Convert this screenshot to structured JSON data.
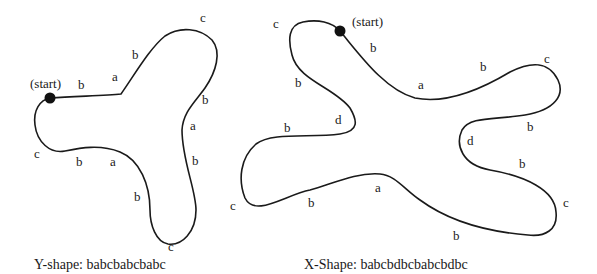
{
  "figure": {
    "y_shape": {
      "caption": "Y-shape: babcbabcbabc",
      "start_label": "(start)",
      "edge_labels": [
        {
          "text": "b",
          "x": 78,
          "y": 78
        },
        {
          "text": "a",
          "x": 112,
          "y": 70
        },
        {
          "text": "b",
          "x": 132,
          "y": 48
        },
        {
          "text": "c",
          "x": 200,
          "y": 11
        },
        {
          "text": "b",
          "x": 202,
          "y": 93
        },
        {
          "text": "a",
          "x": 190,
          "y": 119
        },
        {
          "text": "b",
          "x": 192,
          "y": 154
        },
        {
          "text": "b",
          "x": 134,
          "y": 190
        },
        {
          "text": "c",
          "x": 168,
          "y": 240
        },
        {
          "text": "a",
          "x": 110,
          "y": 155
        },
        {
          "text": "b",
          "x": 76,
          "y": 155
        },
        {
          "text": "c",
          "x": 34,
          "y": 147
        }
      ]
    },
    "x_shape": {
      "caption": "X-Shape: babcbdbcbabcbdbc",
      "start_label": "(start)",
      "edge_labels": [
        {
          "text": "b",
          "x": 370,
          "y": 41
        },
        {
          "text": "a",
          "x": 418,
          "y": 78
        },
        {
          "text": "b",
          "x": 480,
          "y": 60
        },
        {
          "text": "c",
          "x": 544,
          "y": 52
        },
        {
          "text": "b",
          "x": 527,
          "y": 120
        },
        {
          "text": "d",
          "x": 467,
          "y": 134
        },
        {
          "text": "b",
          "x": 519,
          "y": 157
        },
        {
          "text": "c",
          "x": 563,
          "y": 196
        },
        {
          "text": "b",
          "x": 453,
          "y": 229
        },
        {
          "text": "a",
          "x": 375,
          "y": 181
        },
        {
          "text": "b",
          "x": 308,
          "y": 196
        },
        {
          "text": "c",
          "x": 230,
          "y": 199
        },
        {
          "text": "b",
          "x": 284,
          "y": 121
        },
        {
          "text": "d",
          "x": 335,
          "y": 113
        },
        {
          "text": "b",
          "x": 295,
          "y": 76
        },
        {
          "text": "c",
          "x": 273,
          "y": 17
        }
      ]
    }
  }
}
